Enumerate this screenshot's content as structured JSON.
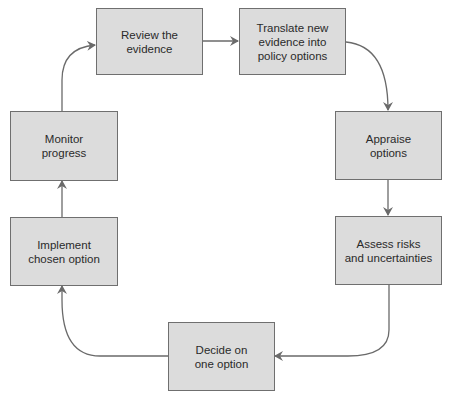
{
  "diagram": {
    "type": "cycle-flowchart",
    "colors": {
      "box_fill": "#dcdcdc",
      "box_border": "#6f6f6f",
      "arrow": "#6a6a6a",
      "text": "#2a2a2a"
    },
    "nodes": [
      {
        "id": "review",
        "label": "Review the\nevidence"
      },
      {
        "id": "translate",
        "label": "Translate new\nevidence into\npolicy options"
      },
      {
        "id": "appraise",
        "label": "Appraise\noptions"
      },
      {
        "id": "assess",
        "label": "Assess risks\nand uncertainties"
      },
      {
        "id": "decide",
        "label": "Decide on\none option"
      },
      {
        "id": "implement",
        "label": "Implement\nchosen option"
      },
      {
        "id": "monitor",
        "label": "Monitor\nprogress"
      }
    ],
    "edges": [
      {
        "from": "review",
        "to": "translate"
      },
      {
        "from": "translate",
        "to": "appraise"
      },
      {
        "from": "appraise",
        "to": "assess"
      },
      {
        "from": "assess",
        "to": "decide"
      },
      {
        "from": "decide",
        "to": "implement"
      },
      {
        "from": "implement",
        "to": "monitor"
      },
      {
        "from": "monitor",
        "to": "review"
      }
    ]
  }
}
